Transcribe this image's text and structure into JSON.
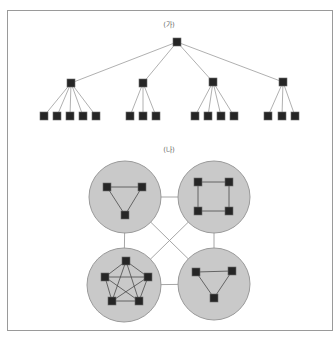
{
  "figure": {
    "frame": {
      "x": 7,
      "y": 10,
      "width": 325,
      "height": 320
    },
    "colors": {
      "frame": "#9a9a9a",
      "edge": "#9c9c9c",
      "inner_edge": "#4a4a4a",
      "cluster_fill": "#c9c9c9",
      "cluster_stroke": "#9a9a9a",
      "node_fill": "#262626",
      "label": "#6a6a6a"
    },
    "node_size": 8
  },
  "panels": [
    {
      "id": "tree",
      "label": "(가)",
      "label_pos": {
        "x": 169,
        "y": 27
      },
      "type": "hierarchical-tree",
      "nodes": [
        {
          "id": "root",
          "x": 177,
          "y": 42
        },
        {
          "id": "m1",
          "x": 71,
          "y": 83
        },
        {
          "id": "m2",
          "x": 143,
          "y": 83
        },
        {
          "id": "m3",
          "x": 213,
          "y": 82
        },
        {
          "id": "m4",
          "x": 283,
          "y": 82
        },
        {
          "id": "l1",
          "x": 44,
          "y": 116
        },
        {
          "id": "l2",
          "x": 57,
          "y": 116
        },
        {
          "id": "l3",
          "x": 70,
          "y": 116
        },
        {
          "id": "l4",
          "x": 83,
          "y": 116
        },
        {
          "id": "l5",
          "x": 96,
          "y": 116
        },
        {
          "id": "l6",
          "x": 130,
          "y": 116
        },
        {
          "id": "l7",
          "x": 143,
          "y": 116
        },
        {
          "id": "l8",
          "x": 156,
          "y": 116
        },
        {
          "id": "l9",
          "x": 195,
          "y": 116
        },
        {
          "id": "l10",
          "x": 208,
          "y": 116
        },
        {
          "id": "l11",
          "x": 221,
          "y": 116
        },
        {
          "id": "l12",
          "x": 234,
          "y": 116
        },
        {
          "id": "l13",
          "x": 268,
          "y": 116
        },
        {
          "id": "l14",
          "x": 282,
          "y": 116
        },
        {
          "id": "l15",
          "x": 295,
          "y": 116
        }
      ],
      "edges": [
        [
          "root",
          "m1"
        ],
        [
          "root",
          "m2"
        ],
        [
          "root",
          "m3"
        ],
        [
          "root",
          "m4"
        ],
        [
          "m1",
          "l1"
        ],
        [
          "m1",
          "l2"
        ],
        [
          "m1",
          "l3"
        ],
        [
          "m1",
          "l4"
        ],
        [
          "m1",
          "l5"
        ],
        [
          "m2",
          "l6"
        ],
        [
          "m2",
          "l7"
        ],
        [
          "m2",
          "l8"
        ],
        [
          "m3",
          "l9"
        ],
        [
          "m3",
          "l10"
        ],
        [
          "m3",
          "l11"
        ],
        [
          "m3",
          "l12"
        ],
        [
          "m4",
          "l13"
        ],
        [
          "m4",
          "l14"
        ],
        [
          "m4",
          "l15"
        ]
      ]
    },
    {
      "id": "clusters",
      "label": "(나)",
      "label_pos": {
        "x": 169,
        "y": 152
      },
      "type": "clustered-network",
      "clusters": [
        {
          "id": "c-top-left",
          "cx": 125,
          "cy": 197,
          "r": 36,
          "topology": "triangle",
          "nodes": [
            {
              "id": "a1",
              "x": 107,
              "y": 187
            },
            {
              "id": "a2",
              "x": 142,
              "y": 187
            },
            {
              "id": "a3",
              "x": 125,
              "y": 215
            }
          ],
          "edges": [
            [
              "a1",
              "a2"
            ],
            [
              "a2",
              "a3"
            ],
            [
              "a3",
              "a1"
            ]
          ]
        },
        {
          "id": "c-top-right",
          "cx": 214,
          "cy": 197,
          "r": 36,
          "topology": "ring-square",
          "nodes": [
            {
              "id": "b1",
              "x": 198,
              "y": 182
            },
            {
              "id": "b2",
              "x": 229,
              "y": 182
            },
            {
              "id": "b3",
              "x": 229,
              "y": 211
            },
            {
              "id": "b4",
              "x": 198,
              "y": 211
            }
          ],
          "edges": [
            [
              "b1",
              "b2"
            ],
            [
              "b2",
              "b3"
            ],
            [
              "b3",
              "b4"
            ],
            [
              "b4",
              "b1"
            ]
          ]
        },
        {
          "id": "c-bottom-left",
          "cx": 124,
          "cy": 285,
          "r": 37,
          "topology": "complete-pentagon",
          "nodes": [
            {
              "id": "c1",
              "x": 126,
              "y": 261
            },
            {
              "id": "c2",
              "x": 148,
              "y": 277
            },
            {
              "id": "c3",
              "x": 139,
              "y": 301
            },
            {
              "id": "c4",
              "x": 112,
              "y": 301
            },
            {
              "id": "c5",
              "x": 105,
              "y": 277
            }
          ],
          "edges": [
            [
              "c1",
              "c2"
            ],
            [
              "c1",
              "c3"
            ],
            [
              "c1",
              "c4"
            ],
            [
              "c1",
              "c5"
            ],
            [
              "c2",
              "c3"
            ],
            [
              "c2",
              "c4"
            ],
            [
              "c2",
              "c5"
            ],
            [
              "c3",
              "c4"
            ],
            [
              "c3",
              "c5"
            ],
            [
              "c4",
              "c5"
            ]
          ]
        },
        {
          "id": "c-bottom-right",
          "cx": 214,
          "cy": 284,
          "r": 36,
          "topology": "triangle",
          "nodes": [
            {
              "id": "d1",
              "x": 196,
              "y": 272
            },
            {
              "id": "d2",
              "x": 232,
              "y": 271
            },
            {
              "id": "d3",
              "x": 214,
              "y": 298
            }
          ],
          "edges": [
            [
              "d1",
              "d2"
            ],
            [
              "d2",
              "d3"
            ],
            [
              "d3",
              "d1"
            ]
          ]
        }
      ],
      "links": [
        [
          "c-top-left",
          "c-top-right"
        ],
        [
          "c-bottom-left",
          "c-bottom-right"
        ],
        [
          "c-top-left",
          "c-bottom-left"
        ],
        [
          "c-top-right",
          "c-bottom-right"
        ],
        [
          "c-top-left",
          "c-bottom-right"
        ],
        [
          "c-top-right",
          "c-bottom-left"
        ]
      ]
    }
  ]
}
